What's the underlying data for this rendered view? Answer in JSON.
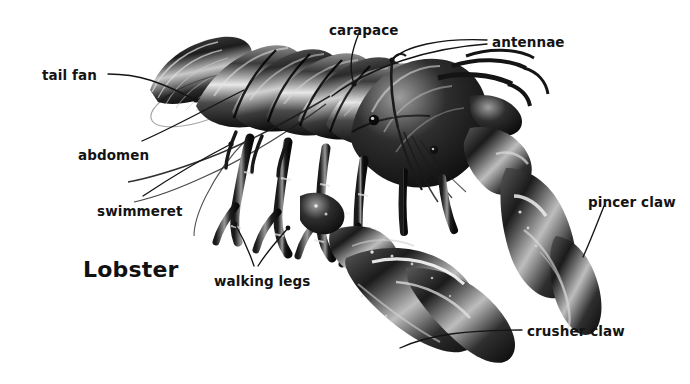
{
  "figure": {
    "title": "Lobster",
    "background_color": "#ffffff",
    "ink_color": "#141414",
    "style": "black-and-white engraving"
  },
  "labels": [
    {
      "id": "tail-fan",
      "text": "tail fan",
      "x": 42,
      "y": 69,
      "anchor": "left"
    },
    {
      "id": "abdomen",
      "text": "abdomen",
      "x": 78,
      "y": 149,
      "anchor": "left"
    },
    {
      "id": "swimmeret",
      "text": "swimmeret",
      "x": 97,
      "y": 205,
      "anchor": "left"
    },
    {
      "id": "walking-legs",
      "text": "walking legs",
      "x": 214,
      "y": 275,
      "anchor": "left"
    },
    {
      "id": "carapace",
      "text": "carapace",
      "x": 329,
      "y": 24,
      "anchor": "left"
    },
    {
      "id": "antennae",
      "text": "antennae",
      "x": 492,
      "y": 36,
      "anchor": "left"
    },
    {
      "id": "pincer-claw",
      "text": "pincer claw",
      "x": 588,
      "y": 196,
      "anchor": "left"
    },
    {
      "id": "crusher-claw",
      "text": "crusher claw",
      "x": 527,
      "y": 325,
      "anchor": "left"
    }
  ],
  "leader_lines": [
    {
      "id": "leader-tail-fan",
      "path": "M108,74 C140,74 160,82 196,100",
      "dot": [
        196,
        100
      ]
    },
    {
      "id": "leader-abdomen",
      "path": "M142,141 C176,126 208,108 244,90",
      "dot": null
    },
    {
      "id": "leader-swimmeret",
      "path": "M143,196 C170,178 200,160 231,144",
      "dot": [
        231,
        144
      ]
    },
    {
      "id": "leader-walking-a",
      "path": "M254,266 C248,248 242,236 235,224",
      "dot": [
        235,
        224
      ]
    },
    {
      "id": "leader-walking-b",
      "path": "M258,266 C268,250 278,240 288,228",
      "dot": [
        288,
        228
      ]
    },
    {
      "id": "leader-carapace",
      "path": "M359,33 C352,50 348,66 354,84",
      "dot": [
        354,
        84
      ]
    },
    {
      "id": "leader-antennae-1",
      "path": "M487,40 C440,38 405,46 392,60",
      "dot": [
        392,
        60
      ]
    },
    {
      "id": "leader-antennae-2",
      "path": "M487,44 C430,48 372,66 332,96",
      "dot": null
    },
    {
      "id": "leader-pincer-claw",
      "path": "M604,206 C596,226 590,242 583,257",
      "dot": null
    },
    {
      "id": "leader-crusher-claw",
      "path": "M522,330 C470,330 430,334 400,348",
      "dot": null
    }
  ],
  "anatomy_parts": [
    "tail fan",
    "abdomen",
    "swimmeret",
    "walking legs",
    "carapace",
    "antennae",
    "pincer claw",
    "crusher claw"
  ]
}
